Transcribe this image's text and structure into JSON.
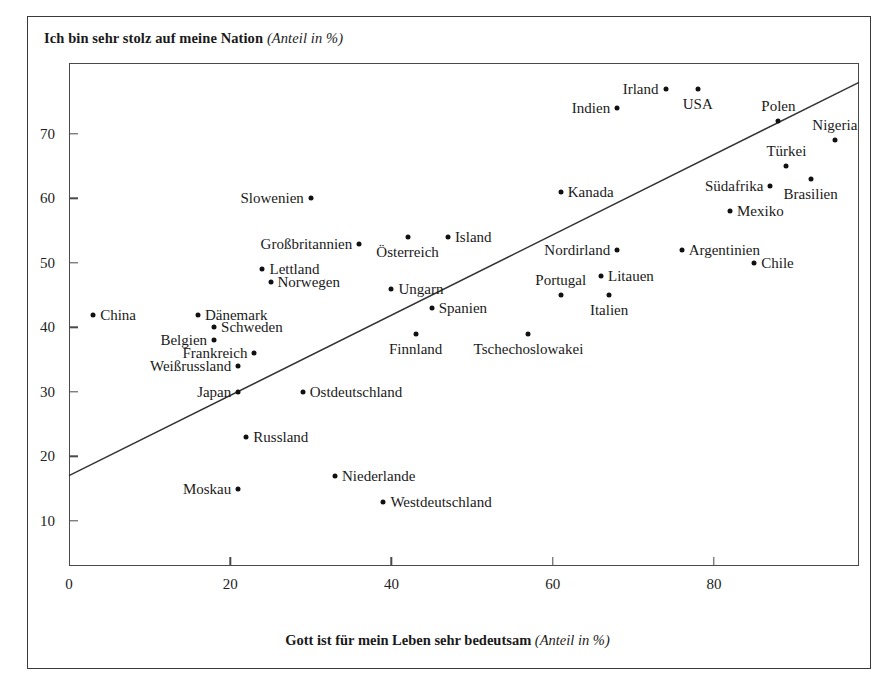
{
  "figure": {
    "y_axis_caption_bold": "Ich bin sehr stolz auf meine Nation",
    "y_axis_caption_italic": "(Anteil in %)",
    "x_axis_caption_bold": "Gott ist für mein Leben sehr bedeutsam",
    "x_axis_caption_italic": "(Anteil in %)",
    "footer_note": ""
  },
  "chart_data": {
    "type": "scatter",
    "title": "",
    "xlabel": "Gott ist für mein Leben sehr bedeutsam (Anteil in %)",
    "ylabel": "Ich bin sehr stolz auf meine Nation (Anteil in %)",
    "xlim": [
      0,
      98
    ],
    "ylim": [
      3,
      81
    ],
    "xticks": [
      0,
      20,
      40,
      60,
      80
    ],
    "yticks": [
      10,
      20,
      30,
      40,
      50,
      60,
      70
    ],
    "grid": false,
    "legend": null,
    "trendline": {
      "x0": 0,
      "y0": 17,
      "x1": 98,
      "y1": 78
    },
    "points": [
      {
        "label": "China",
        "x": 3,
        "y": 42,
        "label_side": "right"
      },
      {
        "label": "Dänemark",
        "x": 16,
        "y": 42,
        "label_side": "right"
      },
      {
        "label": "Schweden",
        "x": 18,
        "y": 40,
        "label_side": "right"
      },
      {
        "label": "Belgien",
        "x": 18,
        "y": 38,
        "label_side": "left"
      },
      {
        "label": "Weißrussland",
        "x": 21,
        "y": 34,
        "label_side": "left"
      },
      {
        "label": "Japan",
        "x": 21,
        "y": 30,
        "label_side": "left"
      },
      {
        "label": "Frankreich",
        "x": 23,
        "y": 36,
        "label_side": "left"
      },
      {
        "label": "Lettland",
        "x": 24,
        "y": 49,
        "label_side": "right"
      },
      {
        "label": "Norwegen",
        "x": 25,
        "y": 47,
        "label_side": "right"
      },
      {
        "label": "Russland",
        "x": 22,
        "y": 23,
        "label_side": "right"
      },
      {
        "label": "Moskau",
        "x": 21,
        "y": 15,
        "label_side": "left"
      },
      {
        "label": "Ostdeutschland",
        "x": 29,
        "y": 30,
        "label_side": "right"
      },
      {
        "label": "Slowenien",
        "x": 30,
        "y": 60,
        "label_side": "left"
      },
      {
        "label": "Niederlande",
        "x": 33,
        "y": 17,
        "label_side": "right"
      },
      {
        "label": "Großbritannien",
        "x": 36,
        "y": 53,
        "label_side": "left"
      },
      {
        "label": "Österreich",
        "x": 42,
        "y": 54,
        "label_side": "below"
      },
      {
        "label": "Ungarn",
        "x": 40,
        "y": 46,
        "label_side": "right"
      },
      {
        "label": "Finnland",
        "x": 43,
        "y": 39,
        "label_side": "below"
      },
      {
        "label": "Westdeutschland",
        "x": 39,
        "y": 13,
        "label_side": "right"
      },
      {
        "label": "Island",
        "x": 47,
        "y": 54,
        "label_side": "right"
      },
      {
        "label": "Spanien",
        "x": 45,
        "y": 43,
        "label_side": "right"
      },
      {
        "label": "Tschechoslowakei",
        "x": 57,
        "y": 39,
        "label_side": "below"
      },
      {
        "label": "Kanada",
        "x": 61,
        "y": 61,
        "label_side": "right"
      },
      {
        "label": "Portugal",
        "x": 61,
        "y": 45,
        "label_side": "above"
      },
      {
        "label": "Italien",
        "x": 67,
        "y": 45,
        "label_side": "below"
      },
      {
        "label": "Litauen",
        "x": 66,
        "y": 48,
        "label_side": "right"
      },
      {
        "label": "Indien",
        "x": 68,
        "y": 74,
        "label_side": "left"
      },
      {
        "label": "Nordirland",
        "x": 68,
        "y": 52,
        "label_side": "left"
      },
      {
        "label": "Irland",
        "x": 74,
        "y": 77,
        "label_side": "left"
      },
      {
        "label": "USA",
        "x": 78,
        "y": 77,
        "label_side": "below"
      },
      {
        "label": "Argentinien",
        "x": 76,
        "y": 52,
        "label_side": "right"
      },
      {
        "label": "Mexiko",
        "x": 82,
        "y": 58,
        "label_side": "right"
      },
      {
        "label": "Chile",
        "x": 85,
        "y": 50,
        "label_side": "right"
      },
      {
        "label": "Polen",
        "x": 88,
        "y": 72,
        "label_side": "above"
      },
      {
        "label": "Türkei",
        "x": 89,
        "y": 65,
        "label_side": "above"
      },
      {
        "label": "Südafrika",
        "x": 87,
        "y": 62,
        "label_side": "left"
      },
      {
        "label": "Brasilien",
        "x": 92,
        "y": 63,
        "label_side": "below"
      },
      {
        "label": "Nigeria",
        "x": 95,
        "y": 69,
        "label_side": "above"
      }
    ]
  }
}
